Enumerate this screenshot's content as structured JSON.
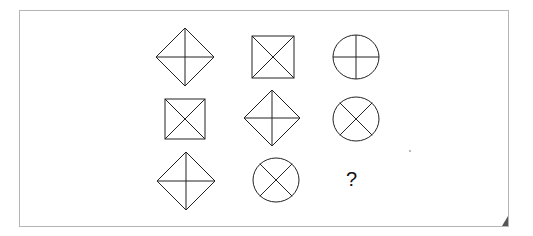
{
  "puzzle": {
    "grid_rows": 3,
    "grid_cols": 3,
    "cells": [
      {
        "row": 0,
        "col": 0,
        "shape": "diamond",
        "lines": "cross-plus",
        "cx": 185,
        "cy": 57,
        "size": 29
      },
      {
        "row": 0,
        "col": 1,
        "shape": "square",
        "lines": "cross-x",
        "cx": 273,
        "cy": 57,
        "size": 21
      },
      {
        "row": 0,
        "col": 2,
        "shape": "circle",
        "lines": "cross-plus",
        "cx": 356,
        "cy": 57,
        "size": 23
      },
      {
        "row": 1,
        "col": 0,
        "shape": "square",
        "lines": "cross-x",
        "cx": 185,
        "cy": 119,
        "size": 20
      },
      {
        "row": 1,
        "col": 1,
        "shape": "diamond",
        "lines": "cross-plus",
        "cx": 272,
        "cy": 118,
        "size": 28
      },
      {
        "row": 1,
        "col": 2,
        "shape": "circle",
        "lines": "cross-x",
        "cx": 356,
        "cy": 119,
        "size": 23
      },
      {
        "row": 2,
        "col": 0,
        "shape": "diamond",
        "lines": "cross-plus",
        "cx": 186,
        "cy": 181,
        "size": 29
      },
      {
        "row": 2,
        "col": 1,
        "shape": "circle",
        "lines": "cross-x",
        "cx": 276,
        "cy": 180,
        "size": 23
      },
      {
        "row": 2,
        "col": 2,
        "shape": "unknown",
        "label": "?",
        "cx": 352,
        "cy": 180
      }
    ],
    "question_label": "?"
  },
  "frame": {
    "border_color": "#b5b5b5",
    "stroke_color": "#222222",
    "corner_fold_color": "#555555"
  }
}
